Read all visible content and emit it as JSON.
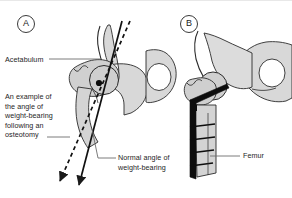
{
  "figure": {
    "kind": "anatomical-line-diagram",
    "background_color": "#ffffff",
    "bone_fill_color": "#d4d4d4",
    "bone_fill_light": "#e6e6e6",
    "outline_color": "#2b2b2b",
    "implant_color": "#0d0d0d",
    "label_color": "#1e1e1e",
    "leader_color": "#6d6d6d"
  },
  "panels": [
    {
      "id": "A",
      "tag": "A"
    },
    {
      "id": "B",
      "tag": "B"
    }
  ],
  "labels": {
    "acetabulum": "Acetabulum",
    "osteotomy_example": "An example of\nthe angle of\nweight-bearing\nfollowing an\nosteotomy",
    "normal_angle": "Normal angle of\nweight-bearing",
    "femur": "Femur"
  },
  "annotations": {
    "solid_axis_name": "normal-angle-of-weight-bearing-axis",
    "dashed_axis_name": "post-osteotomy-angle-of-weight-bearing-axis",
    "rotation_center_name": "femoral-head-center-dot",
    "screw_count": 4
  }
}
